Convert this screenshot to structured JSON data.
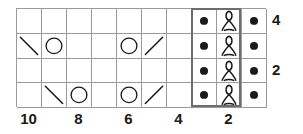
{
  "chart_data": {
    "type": "table",
    "title": "",
    "subtitle": "",
    "xlabel": "",
    "ylabel": "",
    "columns": 10,
    "rows": 4,
    "grid": true,
    "legend_position": "none",
    "column_tick_labels": [
      {
        "column": 10,
        "label": "10"
      },
      {
        "column": 8,
        "label": "8"
      },
      {
        "column": 6,
        "label": "6"
      },
      {
        "column": 4,
        "label": "4"
      },
      {
        "column": 2,
        "label": "2"
      }
    ],
    "row_tick_labels": [
      {
        "row": 4,
        "label": "4"
      },
      {
        "row": 2,
        "label": "2"
      }
    ],
    "symbol_key": {
      "empty": "blank-stitch",
      "dot": "purl-stitch-dot",
      "twist": "twisted-stitch",
      "backslash": "left-leaning-decrease",
      "slash": "right-leaning-decrease",
      "circle": "yarn-over-circle"
    },
    "cells": [
      [
        "empty",
        "empty",
        "empty",
        "empty",
        "empty",
        "empty",
        "empty",
        "dot",
        "twist",
        "dot"
      ],
      [
        "backslash",
        "circle",
        "empty",
        "empty",
        "circle",
        "slash",
        "empty",
        "dot",
        "twist",
        "dot"
      ],
      [
        "empty",
        "empty",
        "empty",
        "empty",
        "empty",
        "empty",
        "empty",
        "dot",
        "twist",
        "dot"
      ],
      [
        "empty",
        "backslash",
        "circle",
        "empty",
        "circle",
        "slash",
        "empty",
        "dot",
        "twist",
        "dot"
      ]
    ],
    "repeat_box": {
      "start_column": 3,
      "end_column": 2,
      "label": ""
    }
  },
  "colors": {
    "grid_line": "#9a9a9a",
    "repeat_border": "#6d6d6d",
    "symbol": "#1a1a1a",
    "background": "#ffffff",
    "label_text": "#1a1a1a"
  }
}
